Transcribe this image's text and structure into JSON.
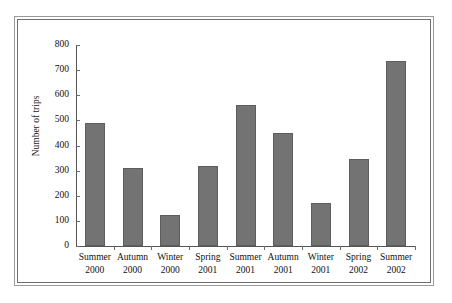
{
  "chart_data": {
    "type": "bar",
    "title": "",
    "xlabel": "",
    "ylabel": "Number of trips",
    "ylim": [
      0,
      800
    ],
    "ytick_step": 100,
    "grid": false,
    "legend": false,
    "bar_color": "#737373",
    "bar_edge_color": "#5d5d5d",
    "categories": [
      "Summer 2000",
      "Autumn 2000",
      "Winter 2000",
      "Spring 2001",
      "Summer 2001",
      "Autumn 2001",
      "Winter 2001",
      "Spring 2002",
      "Summer 2002"
    ],
    "category_lines": [
      {
        "season": "Summer",
        "year": "2000"
      },
      {
        "season": "Autumn",
        "year": "2000"
      },
      {
        "season": "Winter",
        "year": "2000"
      },
      {
        "season": "Spring",
        "year": "2001"
      },
      {
        "season": "Summer",
        "year": "2001"
      },
      {
        "season": "Autumn",
        "year": "2001"
      },
      {
        "season": "Winter",
        "year": "2001"
      },
      {
        "season": "Spring",
        "year": "2002"
      },
      {
        "season": "Summer",
        "year": "2002"
      }
    ],
    "values": [
      488,
      310,
      122,
      318,
      560,
      448,
      170,
      348,
      735
    ],
    "ytick_labels": [
      "800",
      "700",
      "600",
      "500",
      "400",
      "300",
      "200",
      "100",
      "0"
    ],
    "ytick_values": [
      800,
      700,
      600,
      500,
      400,
      300,
      200,
      100,
      0
    ]
  }
}
